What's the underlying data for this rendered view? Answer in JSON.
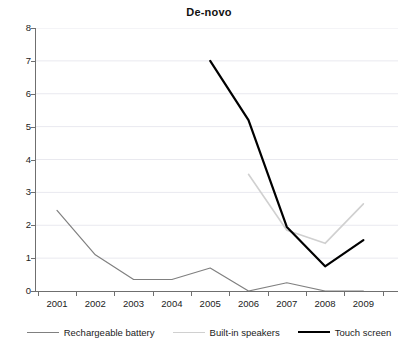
{
  "chart_data": {
    "type": "line",
    "title": "De-novo",
    "xlabel": "",
    "ylabel": "",
    "categories": [
      "2001",
      "2002",
      "2003",
      "2004",
      "2005",
      "2006",
      "2007",
      "2008",
      "2009"
    ],
    "ylim": [
      0,
      8
    ],
    "ytick_labels": [
      "0",
      "1",
      "2",
      "3",
      "4",
      "5",
      "6",
      "7",
      "8"
    ],
    "grid": "horizontal",
    "legend_position": "bottom",
    "series": [
      {
        "name": "Rechargeable battery",
        "color": "#808080",
        "linewidth": 1.2,
        "values": [
          2.45,
          1.1,
          0.35,
          0.35,
          0.7,
          0.0,
          0.25,
          0.0,
          0.0
        ]
      },
      {
        "name": "Built-in speakers",
        "color": "#d0d0d0",
        "linewidth": 1.6,
        "values": [
          null,
          null,
          null,
          null,
          null,
          3.55,
          1.85,
          1.45,
          2.65
        ]
      },
      {
        "name": "Touch screen",
        "color": "#000000",
        "linewidth": 2.2,
        "values": [
          null,
          null,
          null,
          null,
          7.0,
          5.2,
          1.95,
          0.75,
          1.55
        ]
      }
    ]
  }
}
